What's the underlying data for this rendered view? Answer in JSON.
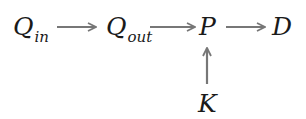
{
  "diagram": {
    "nodes": [
      {
        "id": "q_in",
        "symbol": "Q",
        "subscript": "in"
      },
      {
        "id": "q_out",
        "symbol": "Q",
        "subscript": "out"
      },
      {
        "id": "p",
        "symbol": "P",
        "subscript": ""
      },
      {
        "id": "d",
        "symbol": "D",
        "subscript": ""
      },
      {
        "id": "k",
        "symbol": "K",
        "subscript": ""
      }
    ],
    "edges": [
      {
        "from": "q_in",
        "to": "q_out"
      },
      {
        "from": "q_out",
        "to": "p"
      },
      {
        "from": "p",
        "to": "d"
      },
      {
        "from": "k",
        "to": "p"
      }
    ],
    "arrow_color": "#777777"
  }
}
